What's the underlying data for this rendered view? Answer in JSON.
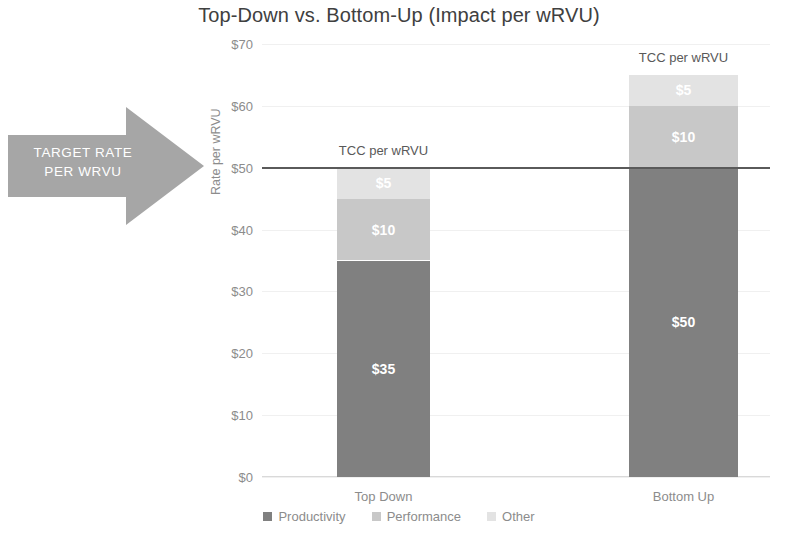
{
  "chart_data": {
    "type": "bar",
    "subtype": "stacked-bar",
    "title": "Top-Down vs. Bottom-Up (Impact per wRVU)",
    "xlabel": "",
    "ylabel": "Rate per wRVU",
    "categories": [
      "Top Down",
      "Bottom Up"
    ],
    "series": [
      {
        "name": "Productivity",
        "values": [
          35,
          50
        ],
        "color": "#808080",
        "labels": [
          "$35",
          "$50"
        ]
      },
      {
        "name": "Performance",
        "values": [
          10,
          10
        ],
        "color": "#c8c8c8",
        "labels": [
          "$10",
          "$10"
        ]
      },
      {
        "name": "Other",
        "values": [
          5,
          5
        ],
        "color": "#e3e3e3",
        "labels": [
          "$5",
          "$5"
        ]
      }
    ],
    "totals": [
      50,
      65
    ],
    "ylim": [
      0,
      70
    ],
    "ytick_values": [
      70,
      60,
      50,
      40,
      30,
      20,
      10,
      0
    ],
    "ytick_labels": [
      "$70",
      "$60",
      "$50",
      "$40",
      "$30",
      "$20",
      "$10",
      "$0"
    ],
    "grid": true,
    "legend_position": "bottom",
    "reference_line": {
      "value": 50,
      "label": "TARGET RATE PER WRVU",
      "color": "#5a5a5a"
    },
    "annotations": [
      {
        "text": "TCC per wRVU",
        "category": "Top Down",
        "at_value": 50
      },
      {
        "text": "TCC per wRVU",
        "category": "Bottom Up",
        "at_value": 65
      }
    ]
  },
  "callout": {
    "line1": "TARGET RATE",
    "line2": "PER WRVU",
    "fill_color": "#a6a6a6"
  },
  "legend": {
    "items": [
      {
        "label": "Productivity",
        "color": "#808080"
      },
      {
        "label": "Performance",
        "color": "#c8c8c8"
      },
      {
        "label": "Other",
        "color": "#e3e3e3"
      }
    ]
  }
}
